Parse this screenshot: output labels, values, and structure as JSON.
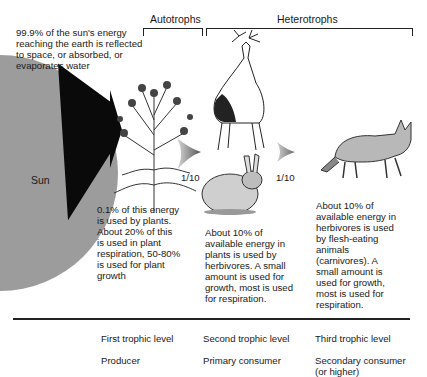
{
  "title_notes": {
    "sun_note": "99.9% of the sun's energy\nreaching the earth is reflected\nto space, or absorbed, or\nevaporates water"
  },
  "brackets": {
    "autotrophs": "Autotrophs",
    "heterotrophs": "Heterotrophs"
  },
  "sun": {
    "label": "Sun",
    "color": "#9a9a9a"
  },
  "arrows": [
    {
      "label": "1/10"
    },
    {
      "label": "1/10"
    }
  ],
  "organisms": [
    {
      "name": "plant",
      "icon": "thistle-plant-icon"
    },
    {
      "name": "deer",
      "icon": "deer-icon"
    },
    {
      "name": "rabbit",
      "icon": "rabbit-icon"
    },
    {
      "name": "wolf",
      "icon": "coyote-icon"
    }
  ],
  "descriptions": {
    "producer": "0.1% of this energy\nis used by plants.\nAbout 20% of this\nis used in plant\nrespiration, 50-80%\nis used for plant\ngrowth",
    "primary": "About 10% of\navailable energy in\nplants is used by\nherbivores. A small\namount is used for\ngrowth, most is used\nfor respiration.",
    "secondary": "About 10% of\navailable energy in\nherbivores is used\nby flesh-eating\nanimals\n(carnivores). A\nsmall amount is\nused for growth,\nmost is used for\nrespiration."
  },
  "levels": [
    {
      "level": "First trophic level",
      "role": "Producer"
    },
    {
      "level": "Second trophic level",
      "role": "Primary consumer"
    },
    {
      "level": "Third trophic level",
      "role": "Secondary consumer\n(or higher)"
    }
  ]
}
